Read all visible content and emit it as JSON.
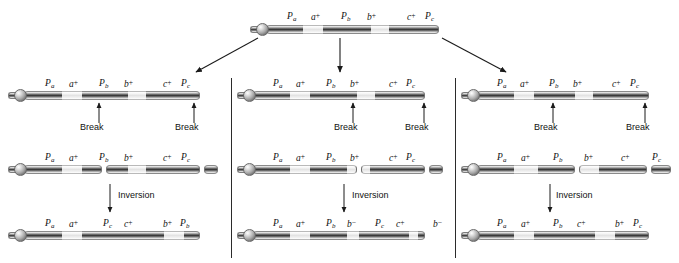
{
  "figure": {
    "type": "genetics-diagram",
    "gene_order_parent": [
      "Pa",
      "a+",
      "Pb",
      "b+",
      "c+",
      "Pc"
    ]
  },
  "parent": {
    "name": "parent-chromosome",
    "labels": [
      {
        "gene": "P",
        "sub": "a",
        "sup": ""
      },
      {
        "gene": "a",
        "sub": "",
        "sup": "+"
      },
      {
        "gene": "P",
        "sub": "b",
        "sup": ""
      },
      {
        "gene": "b",
        "sub": "",
        "sup": "+"
      },
      {
        "gene": "c",
        "sub": "",
        "sup": "+"
      },
      {
        "gene": "P",
        "sub": "c",
        "sup": ""
      }
    ]
  },
  "panels": [
    {
      "id": "panel-left",
      "rows": [
        {
          "id": "break-row",
          "labels": [
            {
              "gene": "P",
              "sub": "a",
              "sup": ""
            },
            {
              "gene": "a",
              "sub": "",
              "sup": "+"
            },
            {
              "gene": "P",
              "sub": "b",
              "sup": ""
            },
            {
              "gene": "b",
              "sub": "",
              "sup": "+"
            },
            {
              "gene": "c",
              "sub": "",
              "sup": "+"
            },
            {
              "gene": "P",
              "sub": "c",
              "sup": ""
            }
          ],
          "break_labels": [
            "Break",
            "Break"
          ]
        },
        {
          "id": "fragment-row",
          "labels": [
            {
              "gene": "P",
              "sub": "a",
              "sup": ""
            },
            {
              "gene": "a",
              "sub": "",
              "sup": "+"
            },
            {
              "gene": "P",
              "sub": "b",
              "sup": ""
            },
            {
              "gene": "b",
              "sub": "",
              "sup": "+"
            },
            {
              "gene": "c",
              "sub": "",
              "sup": "+"
            },
            {
              "gene": "P",
              "sub": "c",
              "sup": ""
            }
          ],
          "step_label": "Inversion"
        },
        {
          "id": "result-row",
          "labels": [
            {
              "gene": "P",
              "sub": "a",
              "sup": ""
            },
            {
              "gene": "a",
              "sub": "",
              "sup": "+"
            },
            {
              "gene": "P",
              "sub": "c",
              "sup": ""
            },
            {
              "gene": "c",
              "sub": "",
              "sup": "+"
            },
            {
              "gene": "b",
              "sub": "",
              "sup": "+"
            },
            {
              "gene": "P",
              "sub": "b",
              "sup": ""
            }
          ]
        }
      ]
    },
    {
      "id": "panel-middle",
      "rows": [
        {
          "id": "break-row",
          "labels": [
            {
              "gene": "P",
              "sub": "a",
              "sup": ""
            },
            {
              "gene": "a",
              "sub": "",
              "sup": "+"
            },
            {
              "gene": "P",
              "sub": "b",
              "sup": ""
            },
            {
              "gene": "b",
              "sub": "",
              "sup": "+"
            },
            {
              "gene": "c",
              "sub": "",
              "sup": "+"
            },
            {
              "gene": "P",
              "sub": "c",
              "sup": ""
            }
          ],
          "break_labels": [
            "Break",
            "Break"
          ]
        },
        {
          "id": "fragment-row",
          "labels": [
            {
              "gene": "P",
              "sub": "a",
              "sup": ""
            },
            {
              "gene": "a",
              "sub": "",
              "sup": "+"
            },
            {
              "gene": "P",
              "sub": "b",
              "sup": ""
            },
            {
              "gene": "b",
              "sub": "",
              "sup": "+"
            },
            {
              "gene": "c",
              "sub": "",
              "sup": "+"
            },
            {
              "gene": "P",
              "sub": "c",
              "sup": ""
            }
          ],
          "step_label": "Inversion"
        },
        {
          "id": "result-row",
          "labels": [
            {
              "gene": "P",
              "sub": "a",
              "sup": ""
            },
            {
              "gene": "a",
              "sub": "",
              "sup": "+"
            },
            {
              "gene": "P",
              "sub": "b",
              "sup": ""
            },
            {
              "gene": "b",
              "sub": "",
              "sup": "−"
            },
            {
              "gene": "P",
              "sub": "c",
              "sup": ""
            },
            {
              "gene": "c",
              "sub": "",
              "sup": "+"
            },
            {
              "gene": "b",
              "sub": "",
              "sup": "−"
            }
          ]
        }
      ]
    },
    {
      "id": "panel-right",
      "rows": [
        {
          "id": "break-row",
          "labels": [
            {
              "gene": "P",
              "sub": "a",
              "sup": ""
            },
            {
              "gene": "a",
              "sub": "",
              "sup": "+"
            },
            {
              "gene": "P",
              "sub": "b",
              "sup": ""
            },
            {
              "gene": "b",
              "sub": "",
              "sup": "+"
            },
            {
              "gene": "c",
              "sub": "",
              "sup": "+"
            },
            {
              "gene": "P",
              "sub": "c",
              "sup": ""
            }
          ],
          "break_labels": [
            "Break",
            "Break"
          ]
        },
        {
          "id": "fragment-row",
          "labels": [
            {
              "gene": "P",
              "sub": "a",
              "sup": ""
            },
            {
              "gene": "a",
              "sub": "",
              "sup": "+"
            },
            {
              "gene": "P",
              "sub": "b",
              "sup": ""
            },
            {
              "gene": "b",
              "sub": "",
              "sup": "+"
            },
            {
              "gene": "c",
              "sub": "",
              "sup": "+"
            },
            {
              "gene": "P",
              "sub": "c",
              "sup": ""
            }
          ],
          "step_label": "Inversion"
        },
        {
          "id": "result-row",
          "labels": [
            {
              "gene": "P",
              "sub": "a",
              "sup": ""
            },
            {
              "gene": "a",
              "sub": "",
              "sup": "+"
            },
            {
              "gene": "P",
              "sub": "b",
              "sup": ""
            },
            {
              "gene": "c",
              "sub": "",
              "sup": "+"
            },
            {
              "gene": "b",
              "sub": "",
              "sup": "+"
            },
            {
              "gene": "P",
              "sub": "c",
              "sup": ""
            }
          ]
        }
      ]
    }
  ],
  "colors": {
    "bar_dark": "#3a3a3a",
    "bar_light": "#e9e9e9",
    "ink": "#1a1a1a",
    "divider": "#2b2b2b"
  }
}
